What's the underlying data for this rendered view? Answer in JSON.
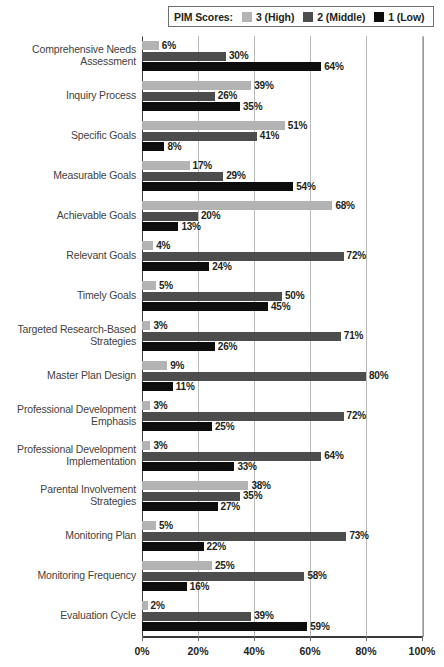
{
  "legend": {
    "title": "PIM Scores:",
    "entries": [
      {
        "label": "3 (High)",
        "color": "#b3b3b3"
      },
      {
        "label": "2 (Middle)",
        "color": "#4d4d4d"
      },
      {
        "label": "1 (Low)",
        "color": "#0d0d0d"
      }
    ]
  },
  "axis": {
    "ticks": [
      "0%",
      "20%",
      "40%",
      "60%",
      "80%",
      "100%"
    ]
  },
  "chart_data": {
    "type": "bar",
    "orientation": "horizontal",
    "grouped": true,
    "title": "",
    "xlabel": "",
    "ylabel": "",
    "xlim": [
      0,
      100
    ],
    "xticks": [
      0,
      20,
      40,
      60,
      80,
      100
    ],
    "grid": "vertical",
    "legend_position": "top",
    "legend_title": "PIM Scores:",
    "value_suffix": "%",
    "categories": [
      "Comprehensive Needs\nAssessment",
      "Inquiry Process",
      "Specific Goals",
      "Measurable Goals",
      "Achievable Goals",
      "Relevant Goals",
      "Timely Goals",
      "Targeted Research-Based\nStrategies",
      "Master Plan Design",
      "Professional Development\nEmphasis",
      "Professional Development\nImplementation",
      "Parental Involvement\nStrategies",
      "Monitoring Plan",
      "Monitoring Frequency",
      "Evaluation Cycle"
    ],
    "series": [
      {
        "name": "3 (High)",
        "color": "#b3b3b3",
        "values": [
          6,
          39,
          51,
          17,
          68,
          4,
          5,
          3,
          9,
          3,
          3,
          38,
          5,
          25,
          2
        ],
        "labels": [
          "6%",
          "39%",
          "51%",
          "17%",
          "68%",
          "4%",
          "5%",
          "3%",
          "9%",
          "3%",
          "3%",
          "38%",
          "5%",
          "25%",
          "2%"
        ]
      },
      {
        "name": "2 (Middle)",
        "color": "#4d4d4d",
        "values": [
          30,
          26,
          41,
          29,
          20,
          72,
          50,
          71,
          80,
          72,
          64,
          35,
          73,
          58,
          39
        ],
        "labels": [
          "30%",
          "26%",
          "41%",
          "29%",
          "20%",
          "72%",
          "50%",
          "71%",
          "80%",
          "72%",
          "64%",
          "35%",
          "73%",
          "58%",
          "39%"
        ]
      },
      {
        "name": "1 (Low)",
        "color": "#0d0d0d",
        "values": [
          64,
          35,
          8,
          54,
          13,
          24,
          45,
          26,
          11,
          25,
          33,
          27,
          22,
          16,
          59
        ],
        "labels": [
          "64%",
          "35%",
          "8%",
          "54%",
          "13%",
          "24%",
          "45%",
          "26%",
          "11%",
          "25%",
          "33%",
          "27%",
          "22%",
          "16%",
          "59%"
        ]
      }
    ]
  }
}
